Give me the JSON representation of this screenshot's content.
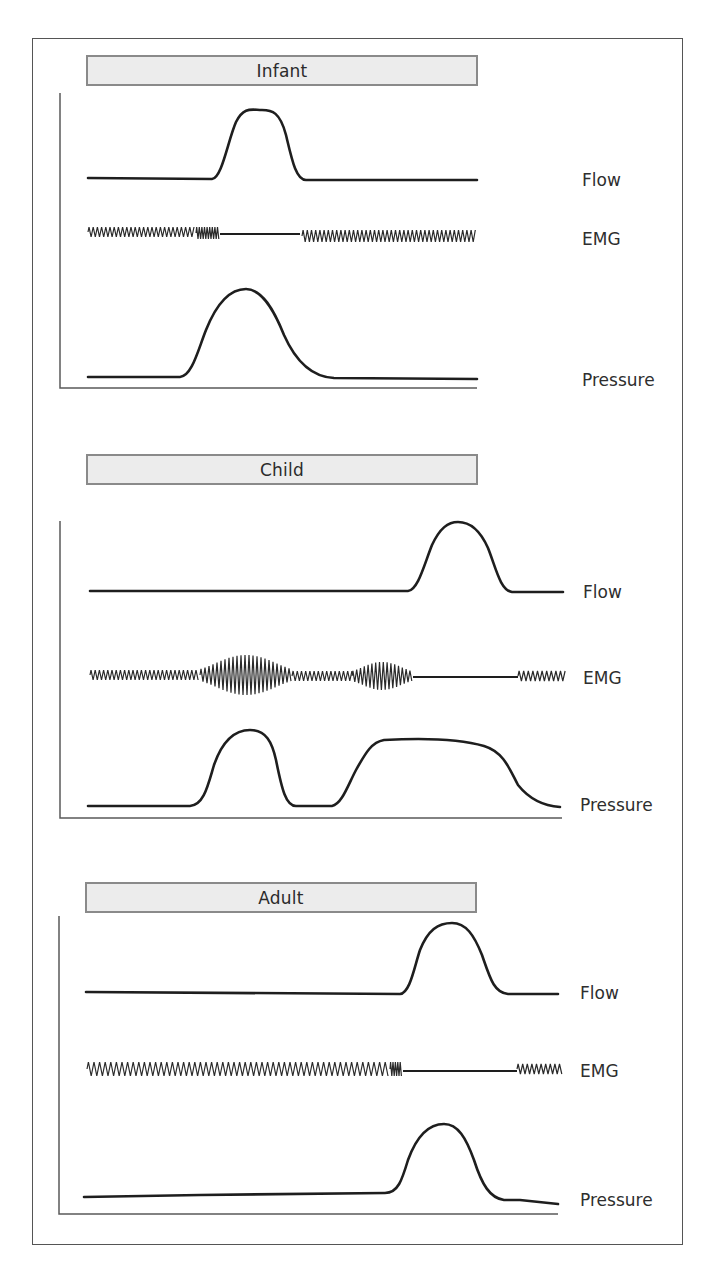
{
  "figure": {
    "panels": [
      {
        "id": "infant",
        "title": "Infant",
        "banner": {
          "x": 86,
          "y": 55,
          "w": 392,
          "h": 31
        },
        "axis": {
          "x": 60,
          "top": 93,
          "bottom": 388,
          "right": 477
        },
        "labels": [
          {
            "text": "Flow",
            "x": 582,
            "y": 170
          },
          {
            "text": "EMG",
            "x": 582,
            "y": 229
          },
          {
            "text": "Pressure",
            "x": 582,
            "y": 370
          }
        ],
        "flow_path": "M88,178 L212,179 C222,178 228,140 236,122 C244,106 252,110 262,110 C272,110 280,112 286,135 C292,160 296,180 306,180 L477,180",
        "pressure_path": "M88,377 L180,377 C192,376 198,350 206,330 C218,300 232,289 246,289 C262,289 274,310 284,335 C296,362 312,377 334,378 L477,379",
        "emg": [
          {
            "type": "zig",
            "x0": 88,
            "x1": 196,
            "y": 232,
            "amp": 5,
            "period": 4.2
          },
          {
            "type": "zig",
            "x0": 196,
            "x1": 220,
            "y": 233,
            "amp": 6,
            "period": 2.6
          },
          {
            "type": "flat",
            "x0": 220,
            "x1": 300,
            "y": 234
          },
          {
            "type": "zig",
            "x0": 302,
            "x1": 477,
            "y": 236,
            "amp": 6,
            "period": 4.2
          }
        ]
      },
      {
        "id": "child",
        "title": "Child",
        "banner": {
          "x": 86,
          "y": 454,
          "w": 392,
          "h": 31
        },
        "axis": {
          "x": 60,
          "top": 521,
          "bottom": 818,
          "right": 562
        },
        "labels": [
          {
            "text": "Flow",
            "x": 583,
            "y": 582
          },
          {
            "text": "EMG",
            "x": 583,
            "y": 668
          },
          {
            "text": "Pressure",
            "x": 580,
            "y": 795
          }
        ],
        "flow_path": "M90,591 L408,591 C418,590 424,565 432,545 C440,528 448,522 458,522 C470,522 480,530 488,548 C496,568 500,590 512,592 L563,592",
        "pressure_path": "M88,806 L190,806 C204,805 208,785 214,765 C222,742 234,730 250,730 C266,730 272,742 276,760 C282,790 286,806 296,806 L332,806 C342,804 348,785 356,770 C366,752 372,742 384,740 C420,738 460,739 484,746 C504,752 510,770 518,785 C530,800 545,806 560,807",
        "emg": [
          {
            "type": "zig",
            "x0": 90,
            "x1": 200,
            "y": 675,
            "amp": 5,
            "period": 4.2
          },
          {
            "type": "burst",
            "x0": 200,
            "x1": 292,
            "y": 675,
            "amp": 20,
            "base": 6,
            "period": 4.0
          },
          {
            "type": "zig",
            "x0": 292,
            "x1": 352,
            "y": 676,
            "amp": 5,
            "period": 4.2
          },
          {
            "type": "burst",
            "x0": 352,
            "x1": 412,
            "y": 676,
            "amp": 14,
            "base": 5,
            "period": 3.8
          },
          {
            "type": "flat",
            "x0": 413,
            "x1": 518,
            "y": 677
          },
          {
            "type": "zig",
            "x0": 518,
            "x1": 566,
            "y": 676,
            "amp": 5,
            "period": 4.6
          }
        ]
      },
      {
        "id": "adult",
        "title": "Adult",
        "banner": {
          "x": 85,
          "y": 882,
          "w": 392,
          "h": 31
        },
        "axis": {
          "x": 59,
          "top": 916,
          "bottom": 1214,
          "right": 558
        },
        "labels": [
          {
            "text": "Flow",
            "x": 580,
            "y": 983
          },
          {
            "text": "EMG",
            "x": 580,
            "y": 1061
          },
          {
            "text": "Pressure",
            "x": 580,
            "y": 1190
          }
        ],
        "flow_path": "M86,992 L400,994 C410,993 414,968 420,950 C428,930 438,923 452,923 C466,923 474,935 482,955 C490,978 494,993 508,994 L558,994",
        "pressure_path": "M84,1197 L200,1195 L385,1193 C398,1193 402,1180 408,1160 C416,1138 428,1124 444,1124 C458,1124 466,1138 474,1160 C482,1185 490,1198 504,1200 L520,1200 L558,1204",
        "emg": [
          {
            "type": "zig",
            "x0": 87,
            "x1": 390,
            "y": 1069,
            "amp": 7,
            "period": 5.6
          },
          {
            "type": "zig",
            "x0": 390,
            "x1": 402,
            "y": 1069,
            "amp": 7,
            "period": 2.4
          },
          {
            "type": "flat",
            "x0": 403,
            "x1": 517,
            "y": 1071
          },
          {
            "type": "zig",
            "x0": 517,
            "x1": 562,
            "y": 1069,
            "amp": 5,
            "period": 4.6
          }
        ]
      }
    ]
  },
  "style": {
    "banner_fill": "#ececec",
    "banner_border": "#8a8a8a",
    "trace_color": "#1e1e1e",
    "axis_color": "#5a5a5a",
    "frame_color": "#555555"
  }
}
